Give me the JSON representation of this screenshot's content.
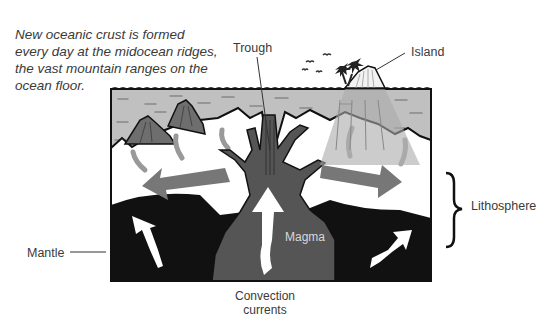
{
  "caption": {
    "lines": [
      "New oceanic crust is formed",
      "every day at the midocean ridges,",
      "the vast mountain ranges on the",
      "ocean floor."
    ]
  },
  "labels": {
    "trough": "Trough",
    "island": "Island",
    "lithosphere": "Lithosphere",
    "mantle": "Mantle",
    "magma": "Magma",
    "convection_line1": "Convection",
    "convection_line2": "currents"
  },
  "colors": {
    "ocean": "#bdbdbd",
    "crust": "#ffffff",
    "mantle": "#111111",
    "magma": "#555555",
    "arrow": "#777777",
    "volcano": "#6e6e6e"
  }
}
